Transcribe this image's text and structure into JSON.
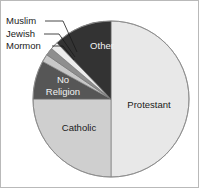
{
  "chart_data": {
    "type": "pie",
    "title": "",
    "subtitle": "",
    "xlabel": "",
    "ylabel": "",
    "legend_position": "none",
    "grid": false,
    "start_angle_deg": 0,
    "direction": "clockwise",
    "center": {
      "x": 110,
      "y": 98
    },
    "radius": 78,
    "categories": [
      "Protestant",
      "Catholic",
      "No Religion",
      "Mormon",
      "Jewish",
      "Muslim",
      "Other"
    ],
    "values": [
      50,
      25,
      8,
      1.6,
      1.6,
      1.6,
      12.2
    ],
    "units": "percent",
    "slices": [
      {
        "label": "Protestant",
        "value": 50,
        "color": "#e8e8e8",
        "label_placement": "inside",
        "label_color": "dark",
        "start_deg": 0,
        "end_deg": 180
      },
      {
        "label": "Catholic",
        "value": 25,
        "color": "#cfcfcf",
        "label_placement": "inside",
        "label_color": "dark",
        "start_deg": 180,
        "end_deg": 270
      },
      {
        "label": "No Religion",
        "value": 8,
        "color": "#565656",
        "label_placement": "inside",
        "label_color": "light",
        "start_deg": 270,
        "end_deg": 298.8
      },
      {
        "label": "Mormon",
        "value": 1.6,
        "color": "#c8c8c8",
        "label_placement": "callout",
        "label_color": "dark",
        "start_deg": 298.8,
        "end_deg": 304.6
      },
      {
        "label": "Jewish",
        "value": 1.6,
        "color": "#8e8e8e",
        "label_placement": "callout",
        "label_color": "dark",
        "start_deg": 304.6,
        "end_deg": 310.4
      },
      {
        "label": "Muslim",
        "value": 1.6,
        "color": "#ededed",
        "label_placement": "callout",
        "label_color": "dark",
        "start_deg": 310.4,
        "end_deg": 316.2
      },
      {
        "label": "Other",
        "value": 12.2,
        "color": "#333333",
        "label_placement": "inside",
        "label_color": "light",
        "start_deg": 316.2,
        "end_deg": 360
      }
    ]
  },
  "labels": {
    "protestant": "Protestant",
    "catholic": "Catholic",
    "no_religion_line1": "No",
    "no_religion_line2": "Religion",
    "other": "Other",
    "muslim": "Muslim",
    "jewish": "Jewish",
    "mormon": "Mormon"
  }
}
